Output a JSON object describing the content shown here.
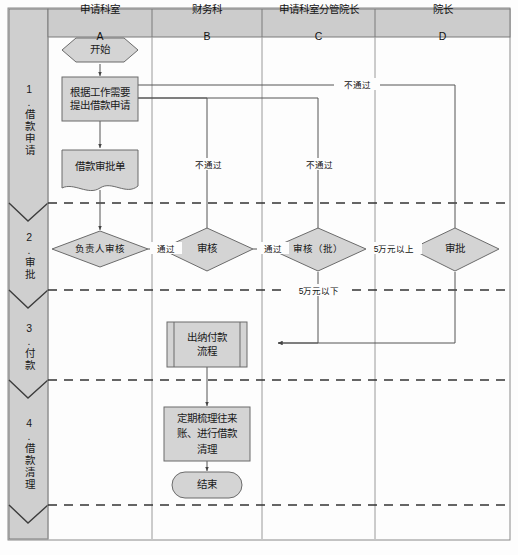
{
  "diagram": {
    "type": "cross-functional-flowchart",
    "colors": {
      "shape_fill": "#d4d4d4",
      "header_fill": "#cccccc",
      "stage_fill": "#cfcfcf",
      "stroke": "#6b6b6b",
      "line": "#555555",
      "text": "#111111",
      "background": "#fdfdfd"
    },
    "columns": [
      {
        "id": "A",
        "name": "申请科室",
        "code": "A"
      },
      {
        "id": "B",
        "name": "财务科",
        "code": "B"
      },
      {
        "id": "C",
        "name": "申请科室分管院长",
        "code": "C"
      },
      {
        "id": "D",
        "name": "院长",
        "code": "D"
      }
    ],
    "stages": [
      {
        "num": "1.",
        "name": "借款申请"
      },
      {
        "num": "2.",
        "name": "审批"
      },
      {
        "num": "3.",
        "name": "付款"
      },
      {
        "num": "4.",
        "name": "借款清理"
      }
    ],
    "nodes": [
      {
        "id": "start",
        "shape": "hexagon",
        "text": "开始"
      },
      {
        "id": "request",
        "shape": "process",
        "text": "根据工作需要\n提出借款申请"
      },
      {
        "id": "form",
        "shape": "document",
        "text": "借款审批单"
      },
      {
        "id": "review_a",
        "shape": "decision",
        "text": "负责人审核"
      },
      {
        "id": "review_b",
        "shape": "decision",
        "text": "审核"
      },
      {
        "id": "review_c",
        "shape": "decision",
        "text": "审核（批）"
      },
      {
        "id": "review_d",
        "shape": "decision",
        "text": "审批"
      },
      {
        "id": "payment",
        "shape": "predefined-process",
        "text": "出纳付款\n流程"
      },
      {
        "id": "clearing",
        "shape": "process",
        "text": "定期梳理往来\n账、进行借款\n清理"
      },
      {
        "id": "end",
        "shape": "terminator",
        "text": "结束"
      }
    ],
    "edge_labels": [
      {
        "id": "pass_ab",
        "text": "通过"
      },
      {
        "id": "pass_bc",
        "text": "通过"
      },
      {
        "id": "over_50k",
        "text": "5万元以上"
      },
      {
        "id": "under_50k",
        "text": "5万元以下"
      },
      {
        "id": "reject_b",
        "text": "不通过"
      },
      {
        "id": "reject_c",
        "text": "不通过"
      },
      {
        "id": "reject_d",
        "text": "不通过"
      }
    ]
  }
}
